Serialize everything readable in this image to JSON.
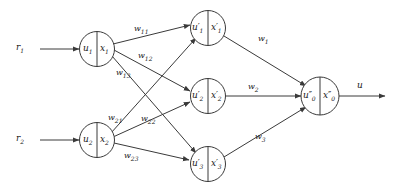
{
  "diagram": {
    "background_color": "#ffffff",
    "stroke_color": "#3a3a3a",
    "text_color": "#1a1a1a",
    "inputs": [
      {
        "name": "input-r1",
        "label": "r",
        "sub": "1"
      },
      {
        "name": "input-r2",
        "label": "r",
        "sub": "2"
      }
    ],
    "input_layer": [
      {
        "name": "node-u1-x1",
        "left_sym": "u",
        "left_sub": "1",
        "right_sym": "x",
        "right_sub": "1"
      },
      {
        "name": "node-u2-x2",
        "left_sym": "u",
        "left_sub": "2",
        "right_sym": "x",
        "right_sub": "2"
      }
    ],
    "hidden_layer": [
      {
        "name": "node-u1p-x1p",
        "left_sym": "u",
        "left_prime": "′",
        "left_sub": "1",
        "right_sym": "x",
        "right_prime": "′",
        "right_sub": "1"
      },
      {
        "name": "node-u2p-x2p",
        "left_sym": "u",
        "left_prime": "′",
        "left_sub": "2",
        "right_sym": "x",
        "right_prime": "′",
        "right_sub": "2"
      },
      {
        "name": "node-u3p-x3p",
        "left_sym": "u",
        "left_prime": "′",
        "left_sub": "3",
        "right_sym": "x",
        "right_prime": "′",
        "right_sub": "3"
      }
    ],
    "output_layer": [
      {
        "name": "node-u0pp-x0pp",
        "left_sym": "u",
        "left_prime": "″",
        "left_sub": "0",
        "right_sym": "x",
        "right_prime": "″",
        "right_sub": "0"
      }
    ],
    "input_weights": [
      {
        "name": "weight-w11",
        "label": "w",
        "sub": "11"
      },
      {
        "name": "weight-w12",
        "label": "w",
        "sub": "12"
      },
      {
        "name": "weight-w13",
        "label": "w",
        "sub": "13"
      },
      {
        "name": "weight-w21",
        "label": "w",
        "sub": "21"
      },
      {
        "name": "weight-w22",
        "label": "w",
        "sub": "22"
      },
      {
        "name": "weight-w23",
        "label": "w",
        "sub": "23"
      }
    ],
    "output_weights": [
      {
        "name": "weight-w1",
        "label": "w",
        "sub": "1"
      },
      {
        "name": "weight-w2",
        "label": "w",
        "sub": "2"
      },
      {
        "name": "weight-w3",
        "label": "w",
        "sub": "3"
      }
    ],
    "output": {
      "name": "output-u",
      "label": "u"
    }
  }
}
